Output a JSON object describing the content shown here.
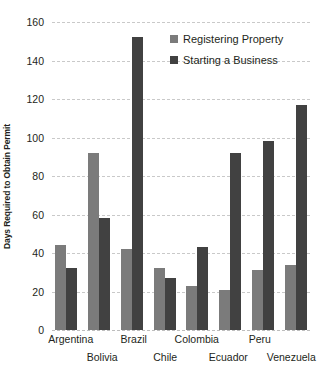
{
  "chart_data": {
    "type": "bar",
    "title": "",
    "xlabel": "",
    "ylabel": "Days Required to Obtain Permit",
    "ylim": [
      0,
      160
    ],
    "ytick_step": 20,
    "yticks": [
      0,
      20,
      40,
      60,
      80,
      100,
      120,
      140,
      160
    ],
    "grid": true,
    "legend_position": "top-right",
    "categories": [
      "Argentina",
      "Bolivia",
      "Brazil",
      "Chile",
      "Colombia",
      "Ecuador",
      "Peru",
      "Venezuela"
    ],
    "series": [
      {
        "name": "Registering Property",
        "color": "#7b7b7b",
        "values": [
          44,
          92,
          42,
          32,
          23,
          21,
          31,
          34
        ]
      },
      {
        "name": "Starting a Business",
        "color": "#414141",
        "values": [
          32,
          58,
          152,
          27,
          43,
          92,
          98,
          117
        ]
      }
    ]
  },
  "axis": {
    "y_title": "Days Required to Obtain Permit",
    "y_tick_labels": [
      "0",
      "20",
      "40",
      "60",
      "80",
      "100",
      "120",
      "140",
      "160"
    ]
  },
  "legend": {
    "items": [
      {
        "label": "Registering Property",
        "swatch": "series-0-swatch"
      },
      {
        "label": "Starting a Business",
        "swatch": "series-1-swatch"
      }
    ]
  },
  "colors": {
    "series_0": "#7b7b7b",
    "series_1": "#414141",
    "grid": "#c9c9c9",
    "text": "#231f20",
    "background": "#ffffff"
  }
}
